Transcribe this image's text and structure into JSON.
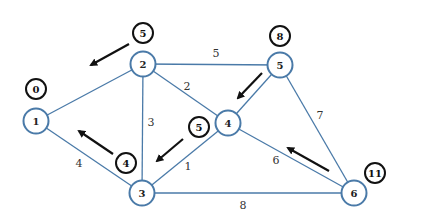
{
  "colors": {
    "edge": "#4a7aa8",
    "node_stroke": "#4a7aa8",
    "dist_stroke": "#111111",
    "arrow": "#111111",
    "background": "#ffffff"
  },
  "nodes": [
    {
      "id": "1",
      "label": "1",
      "x": 36,
      "y": 121,
      "dist": "0",
      "dx": 36,
      "dy": 89
    },
    {
      "id": "2",
      "label": "2",
      "x": 143,
      "y": 64,
      "dist": "5",
      "dx": 143,
      "dy": 33
    },
    {
      "id": "3",
      "label": "3",
      "x": 142,
      "y": 193,
      "dist": "4",
      "dx": 126,
      "dy": 163
    },
    {
      "id": "4",
      "label": "4",
      "x": 228,
      "y": 123,
      "dist": "5",
      "dx": 199,
      "dy": 127
    },
    {
      "id": "5",
      "label": "5",
      "x": 280,
      "y": 65,
      "dist": "8",
      "dx": 280,
      "dy": 36
    },
    {
      "id": "6",
      "label": "6",
      "x": 354,
      "y": 193,
      "dist": "11",
      "dx": 375,
      "dy": 173
    }
  ],
  "edges": [
    {
      "from": "1",
      "to": "2",
      "weight": "",
      "lx": 0,
      "ly": 0
    },
    {
      "from": "2",
      "to": "5",
      "weight": "5",
      "lx": 216,
      "ly": 57
    },
    {
      "from": "2",
      "to": "4",
      "weight": "2",
      "lx": 187,
      "ly": 90
    },
    {
      "from": "2",
      "to": "3",
      "weight": "3",
      "lx": 151,
      "ly": 126
    },
    {
      "from": "1",
      "to": "3",
      "weight": "4",
      "lx": 79,
      "ly": 167
    },
    {
      "from": "3",
      "to": "4",
      "weight": "1",
      "lx": 188,
      "ly": 170
    },
    {
      "from": "4",
      "to": "5",
      "weight": "",
      "lx": 0,
      "ly": 0
    },
    {
      "from": "5",
      "to": "6",
      "weight": "7",
      "lx": 320,
      "ly": 119
    },
    {
      "from": "4",
      "to": "6",
      "weight": "6",
      "lx": 276,
      "ly": 164
    },
    {
      "from": "3",
      "to": "6",
      "weight": "8",
      "lx": 243,
      "ly": 209
    }
  ],
  "arrows": [
    {
      "name": "arrow-near-node-2",
      "x1": 129,
      "y1": 44,
      "x2": 91,
      "y2": 65
    },
    {
      "name": "arrow-near-node-5",
      "x1": 262,
      "y1": 73,
      "x2": 238,
      "y2": 98
    },
    {
      "name": "arrow-near-node-4",
      "x1": 183,
      "y1": 139,
      "x2": 157,
      "y2": 161
    },
    {
      "name": "arrow-near-node-3",
      "x1": 113,
      "y1": 154,
      "x2": 79,
      "y2": 131
    },
    {
      "name": "arrow-near-node-6",
      "x1": 329,
      "y1": 171,
      "x2": 288,
      "y2": 148
    }
  ]
}
